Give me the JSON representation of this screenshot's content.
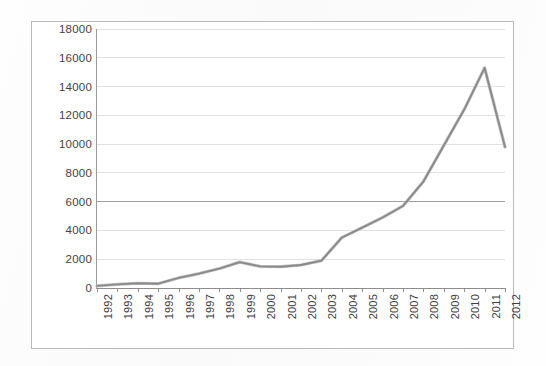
{
  "chart_data": {
    "type": "line",
    "title": "",
    "subtitle": "",
    "xlabel": "",
    "ylabel": "",
    "grid": true,
    "legend": "none",
    "ylim": [
      0,
      18000
    ],
    "ytick_labels": [
      "0",
      "2000",
      "4000",
      "6000",
      "8000",
      "10000",
      "12000",
      "14000",
      "16000",
      "18000"
    ],
    "ytick_values": [
      0,
      2000,
      4000,
      6000,
      8000,
      10000,
      12000,
      14000,
      16000,
      18000
    ],
    "categories": [
      "1992",
      "1993",
      "1994",
      "1995",
      "1996",
      "1997",
      "1998",
      "1999",
      "2000",
      "2001",
      "2002",
      "2003",
      "2004",
      "2005",
      "2006",
      "2007",
      "2008",
      "2009",
      "2010",
      "2011",
      "2012"
    ],
    "x": [
      1992,
      1993,
      1994,
      1995,
      1996,
      1997,
      1998,
      1999,
      2000,
      2001,
      2002,
      2003,
      2004,
      2005,
      2006,
      2007,
      2008,
      2009,
      2010,
      2011,
      2012
    ],
    "series": [
      {
        "name": "series-1",
        "color": "#8a8a8a",
        "values": [
          150,
          250,
          330,
          300,
          700,
          1000,
          1350,
          1800,
          1500,
          1480,
          1600,
          1900,
          3500,
          4200,
          4900,
          5700,
          7400,
          9900,
          12400,
          15300,
          9800
        ]
      }
    ]
  },
  "axes": {
    "y_axis_name": "y-axis",
    "x_axis_name": "x-axis",
    "strong_gridline_value": 6000
  },
  "figure": {
    "border_color": "#b9b9b9",
    "grid_color": "#e2e2e2",
    "line_color": "#8a8a8a",
    "background": "#ffffff"
  }
}
